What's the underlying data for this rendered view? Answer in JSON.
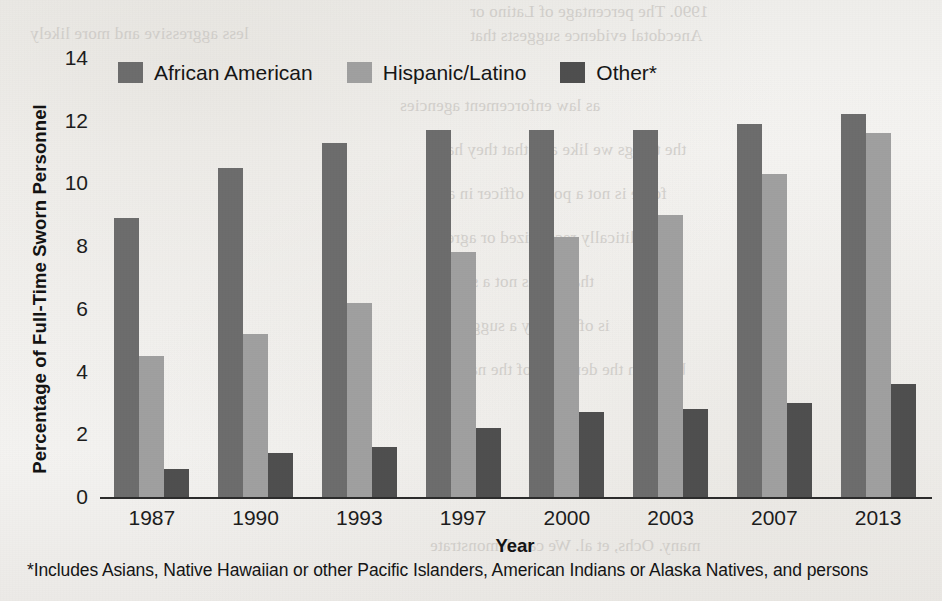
{
  "chart_data": {
    "type": "bar",
    "title": "",
    "xlabel": "Year",
    "ylabel": "Percentage of Full-Time Sworn Personnel",
    "categories": [
      "1987",
      "1990",
      "1993",
      "1997",
      "2000",
      "2003",
      "2007",
      "2013"
    ],
    "yticks": [
      "0",
      "2",
      "4",
      "6",
      "8",
      "10",
      "12",
      "14"
    ],
    "ylim": [
      0,
      14
    ],
    "grid": false,
    "legend_position": "top-left-inside",
    "series": [
      {
        "name": "African American",
        "color": "#6d6d6d",
        "values": [
          8.9,
          10.5,
          11.3,
          11.7,
          11.7,
          11.7,
          11.9,
          12.2
        ]
      },
      {
        "name": "Hispanic/Latino",
        "color": "#a0a0a0",
        "values": [
          4.5,
          5.2,
          6.2,
          7.8,
          8.3,
          9.0,
          10.3,
          11.6
        ]
      },
      {
        "name": "Other*",
        "color": "#4f4f4f",
        "values": [
          0.9,
          1.4,
          1.6,
          2.2,
          2.7,
          2.8,
          3.0,
          3.6
        ]
      }
    ],
    "footnote": "*Includes Asians, Native Hawaiian or other Pacific Islanders, American Indians or Alaska Natives, and persons"
  },
  "legend": [
    {
      "label": "African American",
      "color": "#6d6d6d"
    },
    {
      "label": "Hispanic/Latino",
      "color": "#a0a0a0"
    },
    {
      "label": "Other*",
      "color": "#4f4f4f"
    }
  ],
  "bleed_text": {
    "line1": "1990. The percentage of Latino or",
    "line2": "Anecdotal evidence suggests that",
    "line3": "less aggressive and more likely",
    "line4": "as law enforcement agencies",
    "line5": "the things we like and that they have",
    "line6": "force is not a police officer in any",
    "line7": "a politically recognized or agreed",
    "line8": "that this is not a sign of",
    "line9": "is offered by a suggestion",
    "line10": "between the demands of the national",
    "line11": "many. Ochs, et al. We can demonstrate"
  },
  "page_background": "#f4f3f1"
}
